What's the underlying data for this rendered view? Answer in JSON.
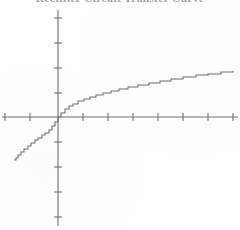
{
  "title": {
    "text": "Rectifier Circuit Transfer Curve",
    "clipped": true,
    "color": "#8e8e8e"
  },
  "axes": {
    "x_axis_label": "",
    "y_axis_label": "",
    "origin_px": {
      "x": 58,
      "y": 117
    },
    "tick_spacing_px": 25,
    "tick_length_px": 7,
    "axis_color": "#6f6f6f",
    "curve_color": "#6a6a6a",
    "x_ticks_px": [
      5,
      30,
      83,
      108,
      133,
      158,
      183,
      208,
      233
    ],
    "y_ticks_px": [
      18,
      43,
      68,
      93,
      142,
      167,
      192,
      217
    ]
  },
  "chart_data": {
    "type": "line",
    "title": "Rectifier Circuit Transfer Curve",
    "xlabel": "",
    "ylabel": "",
    "xlim": [
      -3.5,
      7.3
    ],
    "ylim": [
      -4.2,
      4.0
    ],
    "grid": false,
    "legend": null,
    "series": [
      {
        "name": "f(x)",
        "description": "odd monotonic increasing curve, cube-root shaped, steep near origin, flattening outward",
        "x": [
          -1.78,
          -1.7,
          -1.6,
          -1.48,
          -1.36,
          -1.22,
          -1.08,
          -0.94,
          -0.8,
          -0.66,
          -0.52,
          -0.38,
          -0.24,
          -0.12,
          0.0,
          0.12,
          0.26,
          0.42,
          0.6,
          0.8,
          1.02,
          1.26,
          1.52,
          1.8,
          2.1,
          2.44,
          2.8,
          3.2,
          3.62,
          4.06,
          4.52,
          5.0,
          5.5,
          6.0,
          6.5,
          7.0
        ],
        "y": [
          -1.72,
          -1.62,
          -1.5,
          -1.38,
          -1.26,
          -1.14,
          -1.02,
          -0.92,
          -0.82,
          -0.72,
          -0.62,
          -0.5,
          -0.36,
          -0.2,
          0.0,
          0.18,
          0.32,
          0.44,
          0.54,
          0.64,
          0.72,
          0.8,
          0.88,
          0.96,
          1.04,
          1.12,
          1.2,
          1.28,
          1.36,
          1.44,
          1.52,
          1.6,
          1.68,
          1.74,
          1.8,
          1.86
        ]
      }
    ]
  }
}
